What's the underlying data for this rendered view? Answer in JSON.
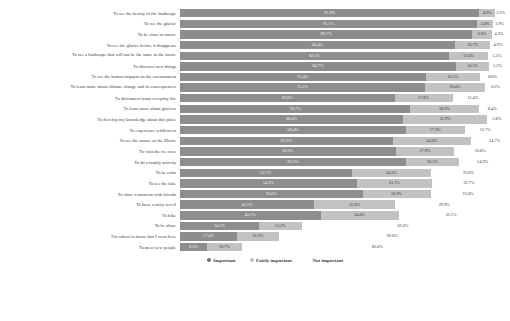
{
  "chart_data": {
    "type": "bar",
    "subtype": "stacked-horizontal-100-percent",
    "title": "",
    "xlabel": "",
    "ylabel": "",
    "xlim": [
      0,
      100
    ],
    "grid": false,
    "legend_position": "bottom-center",
    "value_suffix": "%",
    "categories": [
      "To see the beauty of the landscape",
      "To see the glacier",
      "To be close to nature",
      "To see the glacier before it disappears",
      "To see a landscape that will not be the same in the future",
      "To discover new things",
      "To see the human impacts on the environment",
      "To learn more about climate change and its consequences",
      "To disconnect from everyday life",
      "To learn more about glaciers",
      "To develop my knowledge about this place",
      "To experience wilderness",
      "To see the source of the Rhone",
      "To visit the ice cave",
      "To do a family activity",
      "To be calm",
      "To see the lake",
      "To share a moment with friends",
      "To have a story to tell",
      "To hike",
      "To be alone",
      "For others to know that I went here",
      "To meet new people"
    ],
    "series": [
      {
        "name": "Important",
        "color": "#8d8d8d",
        "values": [
          91.8,
          91.1,
          89.7,
          84.4,
          82.5,
          84.7,
          75.4,
          75.1,
          65.8,
          70.7,
          68.4,
          69.4,
          65.2,
          66.2,
          69.3,
          52.7,
          54.2,
          56.0,
          41.1,
          43.1,
          24.2,
          17.4,
          8.3
        ]
      },
      {
        "name": "Fairly important",
        "color": "#c2c2c2",
        "values": [
          4.9,
          5.0,
          6.0,
          10.7,
          12.0,
          10.1,
          16.5,
          18.4,
          17.8,
          20.9,
          25.9,
          17.9,
          24.0,
          17.9,
          16.3,
          24.3,
          23.1,
          20.9,
          25.0,
          24.0,
          13.2,
          12.9,
          10.7
        ]
      },
      {
        "name": "Not important",
        "color": "#ffffff",
        "values": [
          3.3,
          3.9,
          4.3,
          4.9,
          5.5,
          5.2,
          8.0,
          6.5,
          12.4,
          8.4,
          5.8,
          12.7,
          14.7,
          16.0,
          14.5,
          23.0,
          22.7,
          23.0,
          29.9,
          32.1,
          62.0,
          69.6,
          83.0
        ]
      }
    ],
    "label_display": {
      "0": [
        "91.8%",
        "91.1%",
        "89.7%",
        "84.4%",
        "82.5%",
        "84.7%",
        "75.4%",
        "75.1%",
        "69.8%",
        "70.7%",
        "68.4%",
        "69.4%",
        "65.2%",
        "66.2%",
        "69.3%",
        "52.7%",
        "54.2%",
        "56.0%",
        "41.1%",
        "43.1%",
        "24.2%",
        "17.4%",
        "8.3%"
      ],
      "1": [
        "4.9%",
        "5.0%",
        "6.0%",
        "10.7%",
        "12.0%",
        "10.1%",
        "16.5%",
        "18.4%",
        "17.8%",
        "20.9%",
        "25.9%",
        "17.9%",
        "24.0%",
        "17.9%",
        "16.3%",
        "24.3%",
        "23.1%",
        "20.9%",
        "25.0%",
        "24.0%",
        "13.2%",
        "12.9%",
        "10.7%"
      ],
      "2": [
        "3.3%",
        "3.9%",
        "4.3%",
        "4.9%",
        "5.5%",
        "5.2%",
        "8.0%",
        "6.5%",
        "12.4%",
        "8.4%",
        "5.8%",
        "12.7%",
        "14.7%",
        "16.0%",
        "14.9%",
        "23.0%",
        "22.7%",
        "23.0%",
        "29.9%",
        "32.1%",
        "62.0%",
        "69.6%",
        "83.0%"
      ]
    }
  },
  "legend": {
    "items": [
      {
        "label": "Important",
        "color": "#6f6f6f"
      },
      {
        "label": "Fairly important",
        "color": "#c2c2c2"
      },
      {
        "label": "Not important",
        "color": "#ffffff"
      }
    ]
  }
}
